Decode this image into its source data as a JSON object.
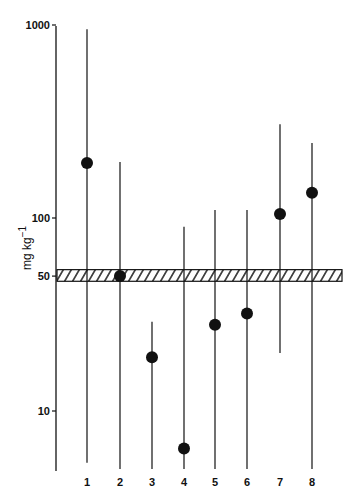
{
  "chart_data": {
    "type": "scatter",
    "title": "",
    "xlabel": "",
    "ylabel": "mg kg−1",
    "yscale": "log",
    "ylim": [
      4.5,
      1000
    ],
    "yticks": [
      10,
      50,
      100,
      1000
    ],
    "ytick_labels": [
      "10",
      "50",
      "100",
      "1000"
    ],
    "categories": [
      "1",
      "2",
      "3",
      "4",
      "5",
      "6",
      "7",
      "8"
    ],
    "series": [
      {
        "name": "median",
        "marker": "filled-circle",
        "values": [
          193,
          50,
          19,
          6.4,
          28,
          32,
          105,
          135
        ]
      },
      {
        "name": "range_max",
        "values": [
          950,
          195,
          29,
          90,
          110,
          110,
          306,
          245
        ]
      },
      {
        "name": "range_min",
        "values": [
          5.4,
          5,
          5,
          5,
          5,
          5,
          20,
          5
        ]
      }
    ],
    "reference_band": {
      "label": "50",
      "low": 47,
      "high": 54,
      "style": "hatched"
    },
    "grid": false,
    "legend": null
  },
  "axis": {
    "ylabel": "mg kg",
    "ylabel_sup": "−1",
    "ticks": [
      {
        "value": 1000,
        "label": "1000"
      },
      {
        "value": 100,
        "label": "100"
      },
      {
        "value": 50,
        "label": "50"
      },
      {
        "value": 10,
        "label": "10"
      }
    ]
  },
  "colors": {
    "ink": "#111111",
    "background": "#ffffff"
  }
}
